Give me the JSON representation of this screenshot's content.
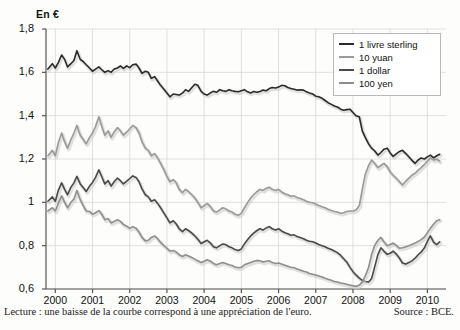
{
  "chart_data": {
    "type": "line",
    "title": "",
    "unit_label": "En €",
    "xlabel": "",
    "ylabel": "",
    "ylim": [
      0.6,
      1.8
    ],
    "yticks": [
      "0,6",
      "0,8",
      "1",
      "1,2",
      "1,4",
      "1,6",
      "1,8"
    ],
    "ytick_values": [
      0.6,
      0.8,
      1.0,
      1.2,
      1.4,
      1.6,
      1.8
    ],
    "xlim": [
      1999.75,
      2010.5
    ],
    "xticks": [
      "2000",
      "2001",
      "2002",
      "2003",
      "2004",
      "2005",
      "2006",
      "2007",
      "2008",
      "2009",
      "2010"
    ],
    "xtick_values": [
      2000,
      2001,
      2002,
      2003,
      2004,
      2005,
      2006,
      2007,
      2008,
      2009,
      2010
    ],
    "grid": true,
    "legend_position": "top-right",
    "legend": [
      "1 livre sterling",
      "10 yuan",
      "1 dollar",
      "100 yen"
    ],
    "series": [
      {
        "name": "1 livre sterling",
        "color": "#2b2b2b",
        "x": [
          1999.8,
          1999.92,
          2000.0,
          2000.08,
          2000.17,
          2000.25,
          2000.33,
          2000.42,
          2000.5,
          2000.58,
          2000.67,
          2000.75,
          2000.83,
          2000.92,
          2001.0,
          2001.08,
          2001.17,
          2001.25,
          2001.33,
          2001.42,
          2001.5,
          2001.58,
          2001.67,
          2001.75,
          2001.83,
          2001.92,
          2002.0,
          2002.08,
          2002.17,
          2002.25,
          2002.33,
          2002.42,
          2002.5,
          2002.58,
          2002.67,
          2002.75,
          2002.83,
          2002.92,
          2003.0,
          2003.08,
          2003.17,
          2003.25,
          2003.33,
          2003.42,
          2003.5,
          2003.58,
          2003.67,
          2003.75,
          2003.83,
          2003.92,
          2004.0,
          2004.08,
          2004.17,
          2004.25,
          2004.33,
          2004.42,
          2004.5,
          2004.58,
          2004.67,
          2004.75,
          2004.83,
          2004.92,
          2005.0,
          2005.08,
          2005.17,
          2005.25,
          2005.33,
          2005.42,
          2005.5,
          2005.58,
          2005.67,
          2005.75,
          2005.83,
          2005.92,
          2006.0,
          2006.08,
          2006.17,
          2006.25,
          2006.33,
          2006.42,
          2006.5,
          2006.58,
          2006.67,
          2006.75,
          2006.83,
          2006.92,
          2007.0,
          2007.08,
          2007.17,
          2007.25,
          2007.33,
          2007.42,
          2007.5,
          2007.58,
          2007.67,
          2007.75,
          2007.83,
          2007.92,
          2008.0,
          2008.08,
          2008.17,
          2008.25,
          2008.33,
          2008.42,
          2008.5,
          2008.58,
          2008.67,
          2008.75,
          2008.83,
          2008.92,
          2009.0,
          2009.08,
          2009.17,
          2009.25,
          2009.33,
          2009.42,
          2009.5,
          2009.58,
          2009.67,
          2009.75,
          2009.83,
          2009.92,
          2010.0,
          2010.08,
          2010.17,
          2010.25,
          2010.33
        ],
        "values": [
          1.615,
          1.64,
          1.62,
          1.645,
          1.68,
          1.66,
          1.625,
          1.64,
          1.655,
          1.7,
          1.66,
          1.65,
          1.635,
          1.62,
          1.605,
          1.615,
          1.625,
          1.612,
          1.6,
          1.608,
          1.6,
          1.615,
          1.62,
          1.63,
          1.618,
          1.63,
          1.622,
          1.635,
          1.638,
          1.62,
          1.595,
          1.605,
          1.6,
          1.572,
          1.58,
          1.56,
          1.54,
          1.522,
          1.505,
          1.487,
          1.5,
          1.498,
          1.495,
          1.505,
          1.52,
          1.512,
          1.53,
          1.545,
          1.54,
          1.512,
          1.5,
          1.495,
          1.505,
          1.513,
          1.508,
          1.52,
          1.515,
          1.512,
          1.52,
          1.515,
          1.512,
          1.51,
          1.515,
          1.52,
          1.51,
          1.505,
          1.512,
          1.508,
          1.512,
          1.518,
          1.515,
          1.525,
          1.53,
          1.528,
          1.532,
          1.54,
          1.538,
          1.53,
          1.525,
          1.522,
          1.518,
          1.52,
          1.518,
          1.51,
          1.505,
          1.5,
          1.49,
          1.487,
          1.48,
          1.47,
          1.46,
          1.452,
          1.445,
          1.44,
          1.43,
          1.425,
          1.428,
          1.43,
          1.415,
          1.4,
          1.395,
          1.33,
          1.3,
          1.27,
          1.25,
          1.238,
          1.218,
          1.23,
          1.245,
          1.25,
          1.228,
          1.212,
          1.225,
          1.235,
          1.24,
          1.225,
          1.21,
          1.195,
          1.18,
          1.195,
          1.205,
          1.2,
          1.21,
          1.218,
          1.205,
          1.215,
          1.222
        ]
      },
      {
        "name": "10 yuan",
        "color": "#9a9a9a",
        "x": [
          1999.8,
          1999.92,
          2000.0,
          2000.08,
          2000.17,
          2000.25,
          2000.33,
          2000.42,
          2000.5,
          2000.58,
          2000.67,
          2000.75,
          2000.83,
          2000.92,
          2001.0,
          2001.08,
          2001.17,
          2001.25,
          2001.33,
          2001.42,
          2001.5,
          2001.58,
          2001.67,
          2001.75,
          2001.83,
          2001.92,
          2002.0,
          2002.08,
          2002.17,
          2002.25,
          2002.33,
          2002.42,
          2002.5,
          2002.58,
          2002.67,
          2002.75,
          2002.83,
          2002.92,
          2003.0,
          2003.08,
          2003.17,
          2003.25,
          2003.33,
          2003.42,
          2003.5,
          2003.58,
          2003.67,
          2003.75,
          2003.83,
          2003.92,
          2004.0,
          2004.08,
          2004.17,
          2004.25,
          2004.33,
          2004.42,
          2004.5,
          2004.58,
          2004.67,
          2004.75,
          2004.83,
          2004.92,
          2005.0,
          2005.08,
          2005.17,
          2005.25,
          2005.33,
          2005.42,
          2005.5,
          2005.58,
          2005.67,
          2005.75,
          2005.83,
          2005.92,
          2006.0,
          2006.08,
          2006.17,
          2006.25,
          2006.33,
          2006.42,
          2006.5,
          2006.58,
          2006.67,
          2006.75,
          2006.83,
          2006.92,
          2007.0,
          2007.08,
          2007.17,
          2007.25,
          2007.33,
          2007.42,
          2007.5,
          2007.58,
          2007.67,
          2007.75,
          2007.83,
          2007.92,
          2008.0,
          2008.08,
          2008.17,
          2008.25,
          2008.33,
          2008.42,
          2008.5,
          2008.58,
          2008.67,
          2008.75,
          2008.83,
          2008.92,
          2009.0,
          2009.08,
          2009.17,
          2009.25,
          2009.33,
          2009.42,
          2009.5,
          2009.58,
          2009.67,
          2009.75,
          2009.83,
          2009.92,
          2010.0,
          2010.08,
          2010.17,
          2010.25,
          2010.33
        ],
        "values": [
          1.215,
          1.24,
          1.215,
          1.275,
          1.32,
          1.28,
          1.25,
          1.29,
          1.32,
          1.355,
          1.31,
          1.29,
          1.27,
          1.3,
          1.32,
          1.35,
          1.395,
          1.35,
          1.31,
          1.33,
          1.3,
          1.325,
          1.345,
          1.33,
          1.31,
          1.325,
          1.34,
          1.355,
          1.345,
          1.32,
          1.28,
          1.25,
          1.24,
          1.215,
          1.225,
          1.205,
          1.18,
          1.15,
          1.12,
          1.095,
          1.105,
          1.09,
          1.06,
          1.045,
          1.06,
          1.05,
          1.035,
          1.02,
          1.0,
          0.975,
          0.985,
          0.995,
          0.98,
          0.96,
          0.955,
          0.965,
          0.975,
          0.97,
          0.96,
          0.955,
          0.945,
          0.94,
          0.95,
          0.975,
          1.0,
          1.02,
          1.035,
          1.05,
          1.06,
          1.055,
          1.065,
          1.07,
          1.06,
          1.055,
          1.06,
          1.048,
          1.04,
          1.035,
          1.028,
          1.03,
          1.022,
          1.018,
          1.012,
          1.005,
          1.0,
          0.998,
          0.992,
          0.985,
          0.98,
          0.975,
          0.968,
          0.962,
          0.958,
          0.955,
          0.95,
          0.952,
          0.958,
          0.96,
          0.96,
          0.965,
          0.985,
          1.06,
          1.13,
          1.17,
          1.195,
          1.18,
          1.16,
          1.17,
          1.18,
          1.165,
          1.14,
          1.125,
          1.11,
          1.095,
          1.08,
          1.098,
          1.112,
          1.125,
          1.135,
          1.148,
          1.16,
          1.175,
          1.19,
          1.205,
          1.195,
          1.2,
          1.19
        ]
      },
      {
        "name": "1 dollar",
        "color": "#4a4a4a",
        "x": [
          1999.8,
          1999.92,
          2000.0,
          2000.08,
          2000.17,
          2000.25,
          2000.33,
          2000.42,
          2000.5,
          2000.58,
          2000.67,
          2000.75,
          2000.83,
          2000.92,
          2001.0,
          2001.08,
          2001.17,
          2001.25,
          2001.33,
          2001.42,
          2001.5,
          2001.58,
          2001.67,
          2001.75,
          2001.83,
          2001.92,
          2002.0,
          2002.08,
          2002.17,
          2002.25,
          2002.33,
          2002.42,
          2002.5,
          2002.58,
          2002.67,
          2002.75,
          2002.83,
          2002.92,
          2003.0,
          2003.08,
          2003.17,
          2003.25,
          2003.33,
          2003.42,
          2003.5,
          2003.58,
          2003.67,
          2003.75,
          2003.83,
          2003.92,
          2004.0,
          2004.08,
          2004.17,
          2004.25,
          2004.33,
          2004.42,
          2004.5,
          2004.58,
          2004.67,
          2004.75,
          2004.83,
          2004.92,
          2005.0,
          2005.08,
          2005.17,
          2005.25,
          2005.33,
          2005.42,
          2005.5,
          2005.58,
          2005.67,
          2005.75,
          2005.83,
          2005.92,
          2006.0,
          2006.08,
          2006.17,
          2006.25,
          2006.33,
          2006.42,
          2006.5,
          2006.58,
          2006.67,
          2006.75,
          2006.83,
          2006.92,
          2007.0,
          2007.08,
          2007.17,
          2007.25,
          2007.33,
          2007.42,
          2007.5,
          2007.58,
          2007.67,
          2007.75,
          2007.83,
          2007.92,
          2008.0,
          2008.08,
          2008.17,
          2008.25,
          2008.33,
          2008.42,
          2008.5,
          2008.58,
          2008.67,
          2008.75,
          2008.83,
          2008.92,
          2009.0,
          2009.08,
          2009.17,
          2009.25,
          2009.33,
          2009.42,
          2009.5,
          2009.58,
          2009.67,
          2009.75,
          2009.83,
          2009.92,
          2010.0,
          2010.08,
          2010.17,
          2010.25,
          2010.33
        ],
        "values": [
          1.005,
          1.025,
          1.005,
          1.055,
          1.09,
          1.06,
          1.035,
          1.07,
          1.09,
          1.12,
          1.085,
          1.068,
          1.05,
          1.075,
          1.092,
          1.115,
          1.15,
          1.118,
          1.085,
          1.1,
          1.075,
          1.095,
          1.112,
          1.1,
          1.085,
          1.098,
          1.11,
          1.122,
          1.115,
          1.095,
          1.062,
          1.035,
          1.025,
          1.005,
          1.012,
          0.995,
          0.975,
          0.95,
          0.928,
          0.905,
          0.915,
          0.9,
          0.878,
          0.865,
          0.878,
          0.87,
          0.858,
          0.845,
          0.83,
          0.81,
          0.818,
          0.825,
          0.812,
          0.795,
          0.79,
          0.8,
          0.808,
          0.805,
          0.795,
          0.79,
          0.782,
          0.778,
          0.785,
          0.808,
          0.828,
          0.845,
          0.858,
          0.87,
          0.878,
          0.872,
          0.882,
          0.888,
          0.878,
          0.872,
          0.878,
          0.868,
          0.86,
          0.855,
          0.848,
          0.85,
          0.842,
          0.838,
          0.832,
          0.825,
          0.82,
          0.818,
          0.812,
          0.805,
          0.8,
          0.795,
          0.788,
          0.782,
          0.775,
          0.768,
          0.755,
          0.74,
          0.725,
          0.7,
          0.68,
          0.665,
          0.65,
          0.64,
          0.635,
          0.632,
          0.648,
          0.7,
          0.76,
          0.79,
          0.775,
          0.76,
          0.765,
          0.775,
          0.76,
          0.742,
          0.72,
          0.715,
          0.722,
          0.73,
          0.742,
          0.758,
          0.77,
          0.79,
          0.82,
          0.845,
          0.815,
          0.805,
          0.818
        ]
      },
      {
        "name": "100 yen",
        "color": "#8f8f8f",
        "x": [
          1999.8,
          1999.92,
          2000.0,
          2000.08,
          2000.17,
          2000.25,
          2000.33,
          2000.42,
          2000.5,
          2000.58,
          2000.67,
          2000.75,
          2000.83,
          2000.92,
          2001.0,
          2001.08,
          2001.17,
          2001.25,
          2001.33,
          2001.42,
          2001.5,
          2001.58,
          2001.67,
          2001.75,
          2001.83,
          2001.92,
          2002.0,
          2002.08,
          2002.17,
          2002.25,
          2002.33,
          2002.42,
          2002.5,
          2002.58,
          2002.67,
          2002.75,
          2002.83,
          2002.92,
          2003.0,
          2003.08,
          2003.17,
          2003.25,
          2003.33,
          2003.42,
          2003.5,
          2003.58,
          2003.67,
          2003.75,
          2003.83,
          2003.92,
          2004.0,
          2004.08,
          2004.17,
          2004.25,
          2004.33,
          2004.42,
          2004.5,
          2004.58,
          2004.67,
          2004.75,
          2004.83,
          2004.92,
          2005.0,
          2005.08,
          2005.17,
          2005.25,
          2005.33,
          2005.42,
          2005.5,
          2005.58,
          2005.67,
          2005.75,
          2005.83,
          2005.92,
          2006.0,
          2006.08,
          2006.17,
          2006.25,
          2006.33,
          2006.42,
          2006.5,
          2006.58,
          2006.67,
          2006.75,
          2006.83,
          2006.92,
          2007.0,
          2007.08,
          2007.17,
          2007.25,
          2007.33,
          2007.42,
          2007.5,
          2007.58,
          2007.67,
          2007.75,
          2007.83,
          2007.92,
          2008.0,
          2008.08,
          2008.17,
          2008.25,
          2008.33,
          2008.42,
          2008.5,
          2008.58,
          2008.67,
          2008.75,
          2008.83,
          2008.92,
          2009.0,
          2009.08,
          2009.17,
          2009.25,
          2009.33,
          2009.42,
          2009.5,
          2009.58,
          2009.67,
          2009.75,
          2009.83,
          2009.92,
          2010.0,
          2010.08,
          2010.17,
          2010.25,
          2010.33
        ],
        "values": [
          0.96,
          0.975,
          0.96,
          0.995,
          1.03,
          1.0,
          0.975,
          1.0,
          1.015,
          1.055,
          1.012,
          0.985,
          0.96,
          0.958,
          0.945,
          0.952,
          0.962,
          0.945,
          0.92,
          0.925,
          0.905,
          0.912,
          0.92,
          0.912,
          0.898,
          0.89,
          0.88,
          0.888,
          0.88,
          0.862,
          0.838,
          0.822,
          0.825,
          0.838,
          0.845,
          0.832,
          0.815,
          0.8,
          0.788,
          0.775,
          0.778,
          0.77,
          0.758,
          0.75,
          0.758,
          0.752,
          0.745,
          0.738,
          0.73,
          0.722,
          0.728,
          0.735,
          0.728,
          0.718,
          0.712,
          0.718,
          0.722,
          0.718,
          0.712,
          0.708,
          0.702,
          0.698,
          0.7,
          0.712,
          0.718,
          0.722,
          0.728,
          0.732,
          0.73,
          0.725,
          0.728,
          0.73,
          0.722,
          0.718,
          0.72,
          0.715,
          0.71,
          0.705,
          0.7,
          0.698,
          0.692,
          0.688,
          0.682,
          0.678,
          0.672,
          0.668,
          0.665,
          0.66,
          0.655,
          0.65,
          0.645,
          0.64,
          0.635,
          0.632,
          0.628,
          0.625,
          0.622,
          0.618,
          0.615,
          0.612,
          0.618,
          0.632,
          0.66,
          0.7,
          0.76,
          0.8,
          0.825,
          0.838,
          0.818,
          0.8,
          0.805,
          0.812,
          0.8,
          0.788,
          0.79,
          0.795,
          0.8,
          0.805,
          0.812,
          0.82,
          0.828,
          0.84,
          0.86,
          0.88,
          0.9,
          0.915,
          0.92
        ]
      }
    ]
  },
  "footer": {
    "note": "Lecture : une baisse de la courbe correspond à une appréciation de l'euro.",
    "source": "Source : BCE."
  }
}
